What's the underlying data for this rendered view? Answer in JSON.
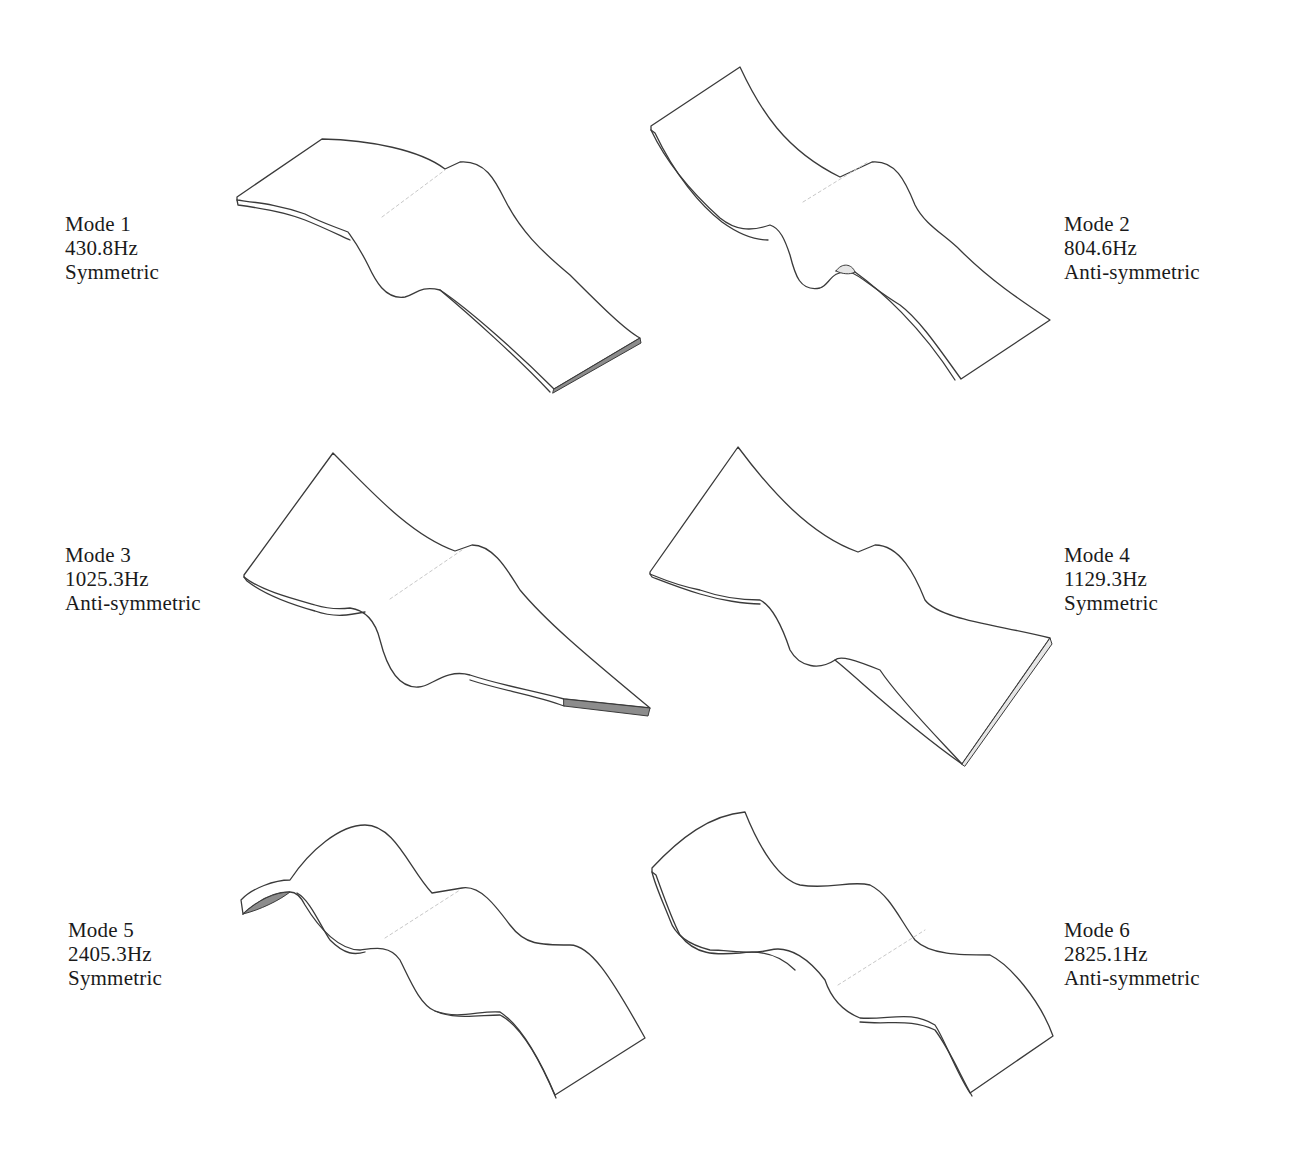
{
  "figure": {
    "modes": [
      {
        "id": 1,
        "title": "Mode 1",
        "frequency": "430.8Hz",
        "symmetry": "Symmetric",
        "label_side": "left"
      },
      {
        "id": 2,
        "title": "Mode 2",
        "frequency": "804.6Hz",
        "symmetry": "Anti-symmetric",
        "label_side": "right"
      },
      {
        "id": 3,
        "title": "Mode 3",
        "frequency": "1025.3Hz",
        "symmetry": "Anti-symmetric",
        "label_side": "left"
      },
      {
        "id": 4,
        "title": "Mode 4",
        "frequency": "1129.3Hz",
        "symmetry": "Symmetric",
        "label_side": "right"
      },
      {
        "id": 5,
        "title": "Mode 5",
        "frequency": "2405.3Hz",
        "symmetry": "Symmetric",
        "label_side": "left"
      },
      {
        "id": 6,
        "title": "Mode 6",
        "frequency": "2825.1Hz",
        "symmetry": "Anti-symmetric",
        "label_side": "right"
      }
    ],
    "colors": {
      "line": "#3a3a3a",
      "edge_shade": "#8c8c8c",
      "text": "#1a1a1a",
      "background": "#ffffff"
    }
  }
}
